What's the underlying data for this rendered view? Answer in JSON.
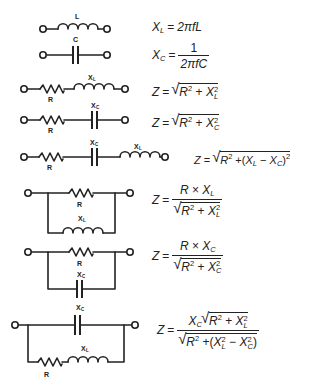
{
  "diagram": {
    "circuits": [
      {
        "id": "inductor",
        "labels": [
          "L"
        ],
        "formula": {
          "lhs": "X",
          "lhs_sub": "L",
          "rhs": "2πfL"
        }
      },
      {
        "id": "capacitor",
        "labels": [
          "C"
        ],
        "formula": {
          "lhs": "X",
          "lhs_sub": "C",
          "num": "1",
          "den": "2πfC"
        }
      },
      {
        "id": "series-rl",
        "labels": [
          "R",
          "X",
          "L"
        ],
        "formula": {
          "lhs": "Z",
          "text": "Z = √(R² + X_L²)"
        }
      },
      {
        "id": "series-rc",
        "labels": [
          "R",
          "X",
          "C"
        ],
        "formula": {
          "lhs": "Z",
          "text": "Z = √(R² + X_C²)"
        }
      },
      {
        "id": "series-rcl",
        "labels": [
          "R",
          "X_C",
          "X_L"
        ],
        "formula": {
          "lhs": "Z",
          "text": "Z = √(R² + (X_L − X_C)²)"
        }
      },
      {
        "id": "parallel-rl",
        "labels": [
          "R",
          "X_L"
        ],
        "formula": {
          "lhs": "Z",
          "text": "Z = (R × X_L) / √(R² + X_L²)"
        }
      },
      {
        "id": "parallel-rc",
        "labels": [
          "R",
          "X_C"
        ],
        "formula": {
          "lhs": "Z",
          "text": "Z = (R × X_C) / √(R² + X_C²)"
        }
      },
      {
        "id": "parallel-c-rl",
        "labels": [
          "X_C",
          "R",
          "X_L"
        ],
        "formula": {
          "lhs": "Z",
          "text": "Z = X_C √(R² + X_L²) / √(R² + (X_L² − X_C²))"
        }
      }
    ],
    "symbols": {
      "Z": "Z",
      "X": "X",
      "R": "R",
      "L": "L",
      "C": "C",
      "eq": "=",
      "plus": "+",
      "minus": "−",
      "times": "×",
      "two": "2",
      "one": "1",
      "lparen": "(",
      "rparen": ")",
      "twopifL": "2πfL",
      "twopifC": "2πfC"
    },
    "component_labels": {
      "L": "L",
      "C": "C",
      "R": "R",
      "X": "X",
      "subL": "L",
      "subC": "C"
    }
  }
}
